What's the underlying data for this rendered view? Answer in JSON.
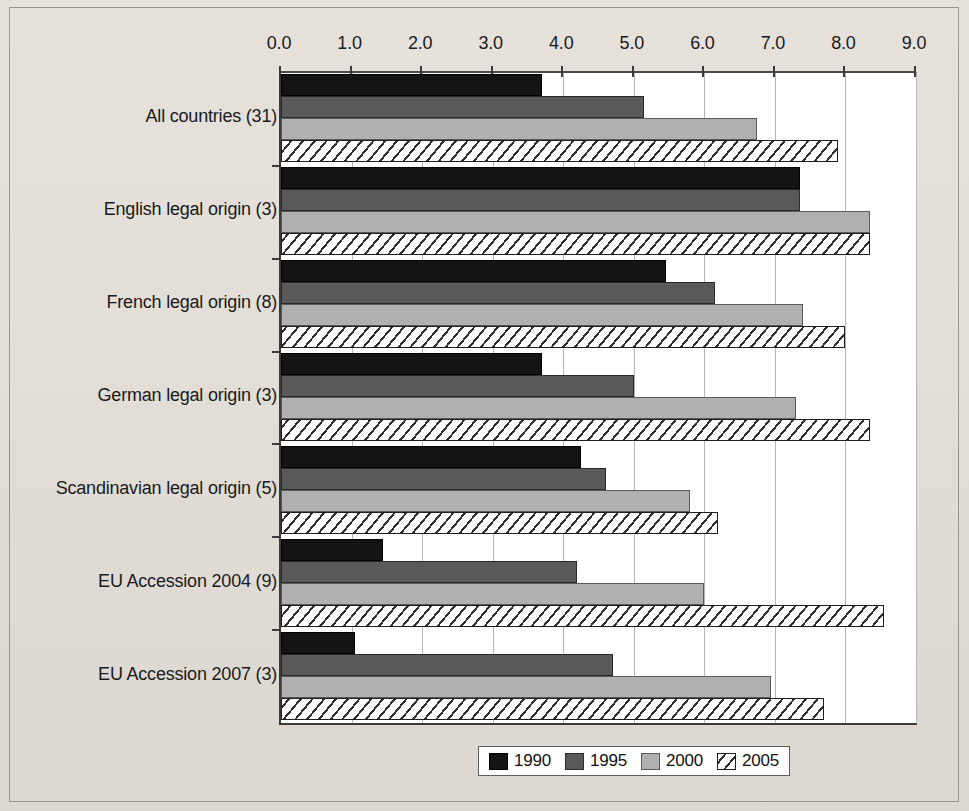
{
  "chart_data": {
    "type": "bar",
    "orientation": "horizontal",
    "title": "",
    "xlabel": "",
    "ylabel": "",
    "xlim": [
      0.0,
      9.0
    ],
    "xticks": [
      "0.0",
      "1.0",
      "2.0",
      "3.0",
      "4.0",
      "5.0",
      "6.0",
      "7.0",
      "8.0",
      "9.0"
    ],
    "grid": true,
    "legend_position": "bottom",
    "categories": [
      "All countries (31)",
      "English legal origin (3)",
      "French legal origin (8)",
      "German legal origin (3)",
      "Scandinavian legal origin (5)",
      "EU Accession 2004 (9)",
      "EU Accession 2007 (3)"
    ],
    "series": [
      {
        "name": "1990",
        "color": "#141414",
        "pattern": "solid",
        "values": [
          3.7,
          7.35,
          5.45,
          3.7,
          4.25,
          1.45,
          1.05
        ]
      },
      {
        "name": "1995",
        "color": "#595959",
        "pattern": "solid",
        "values": [
          5.15,
          7.35,
          6.15,
          5.0,
          4.6,
          4.2,
          4.7
        ]
      },
      {
        "name": "2000",
        "color": "#b0b0b0",
        "pattern": "solid",
        "values": [
          6.75,
          8.35,
          7.4,
          7.3,
          5.8,
          6.0,
          6.95
        ]
      },
      {
        "name": "2005",
        "color": "#ffffff",
        "pattern": "diagonal-hatch",
        "values": [
          7.9,
          8.35,
          8.0,
          8.35,
          6.2,
          8.55,
          7.7
        ]
      }
    ]
  },
  "legend": {
    "items": [
      {
        "label": "1990",
        "swatch": "solid-black-swatch"
      },
      {
        "label": "1995",
        "swatch": "solid-dark-gray-swatch"
      },
      {
        "label": "2000",
        "swatch": "solid-light-gray-swatch"
      },
      {
        "label": "2005",
        "swatch": "hatched-swatch"
      }
    ]
  },
  "colors": {
    "background": "#e3dfd8",
    "plot_background": "#ffffff",
    "axis": "#3a3a3a",
    "gridline": "#b4b4b4",
    "series_1990": "#141414",
    "series_1995": "#595959",
    "series_2000": "#b0b0b0",
    "series_2005": "#ffffff"
  }
}
